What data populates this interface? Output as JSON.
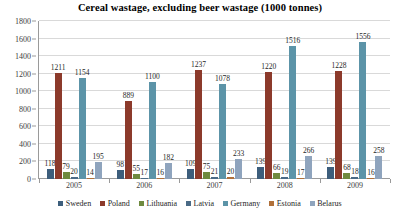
{
  "chart_data": {
    "type": "bar",
    "title": "Cereal wastage, excluding beer wastage (1000 tonnes)",
    "xlabel": "",
    "ylabel": "",
    "ylim": [
      0,
      1800
    ],
    "yticks": [
      0,
      200,
      400,
      600,
      800,
      1000,
      1200,
      1400,
      1600,
      1800
    ],
    "grid": "horizontal",
    "legend_position": "bottom",
    "categories": [
      "2005",
      "2006",
      "2007",
      "2008",
      "2009"
    ],
    "series": [
      {
        "name": "Sweden",
        "color": "#3d5e7c",
        "values": [
          118,
          98,
          109,
          139,
          139
        ]
      },
      {
        "name": "Poland",
        "color": "#8c3a2b",
        "values": [
          1211,
          889,
          1237,
          1220,
          1228
        ]
      },
      {
        "name": "Lithuania",
        "color": "#6f8a3f",
        "values": [
          79,
          55,
          75,
          66,
          68
        ]
      },
      {
        "name": "Latvia",
        "color": "#4a6a86",
        "values": [
          20,
          17,
          21,
          19,
          18
        ]
      },
      {
        "name": "Germany",
        "color": "#5c94a8",
        "values": [
          1154,
          1100,
          1078,
          1516,
          1556
        ]
      },
      {
        "name": "Estonia",
        "color": "#b0703a",
        "values": [
          14,
          16,
          20,
          17,
          16
        ]
      },
      {
        "name": "Belarus",
        "color": "#8fa4bd",
        "values": [
          195,
          182,
          233,
          266,
          258
        ]
      }
    ]
  },
  "colors": {
    "background": "#ffffff",
    "gridline": "#d9d9d9",
    "axis": "#9a9a9a",
    "text": "#262626"
  }
}
